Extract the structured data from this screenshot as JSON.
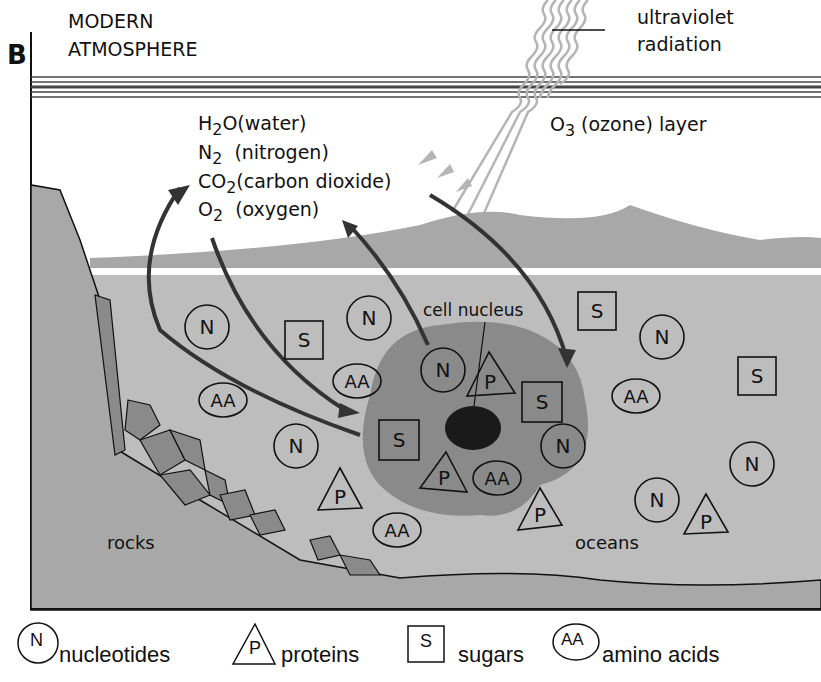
{
  "panel_letter": "B",
  "atmosphere_label": {
    "line1": "MODERN",
    "line2": "ATMOSPHERE"
  },
  "uv_label": {
    "line1": "ultraviolet",
    "line2": "radiation"
  },
  "ozone_label": {
    "formula": "O",
    "sub": "3",
    "text": " (ozone) layer"
  },
  "gases": [
    {
      "formula": "H",
      "sub": "2",
      "rest": "O",
      "name": "(water)"
    },
    {
      "formula": "N",
      "sub": "2",
      "rest": "",
      "name": "(nitrogen)"
    },
    {
      "formula": "CO",
      "sub": "2",
      "rest": "",
      "name": "(carbon dioxide)"
    },
    {
      "formula": "O",
      "sub": "2",
      "rest": "",
      "name": "(oxygen)"
    }
  ],
  "cell_label": "cell nucleus",
  "rocks_label": "rocks",
  "oceans_label": "oceans",
  "symbols": {
    "N": "N",
    "P": "P",
    "S": "S",
    "AA": "AA"
  },
  "legend": [
    {
      "symbol": "N",
      "shape": "circle",
      "label": "nucleotides"
    },
    {
      "symbol": "P",
      "shape": "triangle",
      "label": "proteins"
    },
    {
      "symbol": "S",
      "shape": "square",
      "label": "sugars"
    },
    {
      "symbol": "AA",
      "shape": "ellipse",
      "label": "amino acids"
    }
  ],
  "colors": {
    "ocean": "#bdbdbd",
    "land": "#a8a8a8",
    "cell": "#8a8a8a",
    "nucleus": "#1a1a1a",
    "uv": "#b5b5b5",
    "arrow": "#333333"
  }
}
